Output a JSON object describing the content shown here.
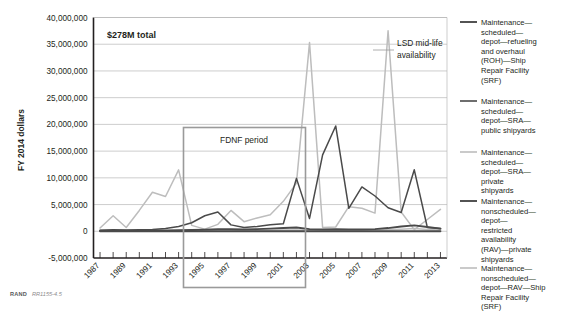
{
  "credit": {
    "org": "RAND",
    "id": "RR1155-4.5"
  },
  "annotations": {
    "total": "$278M total",
    "fdnf": "FDNF period",
    "lsd": "LSD mid-life availability"
  },
  "chart_data": {
    "type": "line",
    "title": "",
    "xlabel": "",
    "ylabel": "FY 2014 dollars",
    "ylim": [
      -5000000,
      40000000
    ],
    "ytick_labels": [
      "40,000,000",
      "35,000,000",
      "30,000,000",
      "25,000,000",
      "20,000,000",
      "15,000,000",
      "10,000,000",
      "5,000,000",
      "0",
      "-5,000,000"
    ],
    "yticks": [
      40000000,
      35000000,
      30000000,
      25000000,
      20000000,
      15000000,
      10000000,
      5000000,
      0,
      -5000000
    ],
    "grid": true,
    "legend_position": "right",
    "xlim": [
      1986.5,
      2013.5
    ],
    "x": [
      1987,
      1988,
      1989,
      1990,
      1991,
      1992,
      1993,
      1994,
      1995,
      1996,
      1997,
      1998,
      1999,
      2000,
      2001,
      2002,
      2003,
      2004,
      2005,
      2006,
      2007,
      2008,
      2009,
      2010,
      2011,
      2012,
      2013
    ],
    "xtick_labels": [
      "1987",
      "1989",
      "1991",
      "1993",
      "1995",
      "1997",
      "1999",
      "2001",
      "2003",
      "2005",
      "2007",
      "2009",
      "2011",
      "2013"
    ],
    "xticks_labeled": [
      1987,
      1989,
      1991,
      1993,
      1995,
      1997,
      1999,
      2001,
      2003,
      2005,
      2007,
      2009,
      2011,
      2013
    ],
    "series": [
      {
        "name": "Maintenance—scheduled—depot—refueling and overhaul (ROH)—Ship Repair Facility (SRF)",
        "color": "#4a4a4a",
        "width": 1.9,
        "values": [
          0,
          0,
          0,
          0,
          0,
          0,
          0,
          0,
          0,
          0,
          0,
          0,
          0,
          0,
          0,
          0,
          0,
          0,
          0,
          0,
          0,
          0,
          0,
          0,
          0,
          0,
          0
        ]
      },
      {
        "name": "Maintenance—scheduled—depot—SRA—public shipyards",
        "color": "#4a4a4a",
        "width": 1.5,
        "values": [
          200000,
          300000,
          250000,
          300000,
          350000,
          500000,
          900000,
          1600000,
          2900000,
          3600000,
          1200000,
          700000,
          900000,
          1200000,
          1400000,
          9900000,
          2400000,
          14300000,
          19700000,
          4300000,
          8300000,
          6600000,
          4400000,
          3500000,
          11500000,
          700000,
          500000
        ]
      },
      {
        "name": "Maintenance—scheduled—depot—SRA—private shipyards",
        "color": "#bdbdbd",
        "width": 1.5,
        "values": [
          600000,
          2900000,
          700000,
          3900000,
          7300000,
          6500000,
          11500000,
          1100000,
          400000,
          1300000,
          3900000,
          1800000,
          2500000,
          3100000,
          5600000,
          9000000,
          35300000,
          700000,
          800000,
          4600000,
          4300000,
          3400000,
          37500000,
          3600000,
          300000,
          2200000,
          4100000
        ]
      },
      {
        "name": "Maintenance—nonscheduled—depot—restricted availability (RAV)—private shipyards",
        "color": "#4a4a4a",
        "width": 1.9,
        "values": [
          100000,
          100000,
          100000,
          100000,
          150000,
          150000,
          200000,
          250000,
          300000,
          400000,
          400000,
          350000,
          400000,
          500000,
          600000,
          700000,
          400000,
          350000,
          400000,
          350000,
          350000,
          400000,
          600000,
          900000,
          1100000,
          800000,
          500000
        ]
      },
      {
        "name": "Maintenance—nonscheduled—depot—RAV—Ship Repair Facility (SRF)",
        "color": "#bdbdbd",
        "width": 1.5,
        "values": [
          80000,
          80000,
          80000,
          80000,
          90000,
          90000,
          100000,
          120000,
          150000,
          150000,
          150000,
          150000,
          200000,
          200000,
          250000,
          250000,
          200000,
          200000,
          200000,
          200000,
          200000,
          250000,
          300000,
          400000,
          500000,
          350000,
          250000
        ]
      }
    ]
  }
}
